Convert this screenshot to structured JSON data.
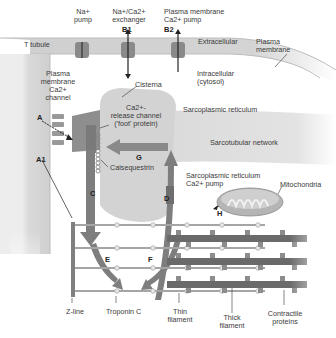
{
  "diagram": {
    "colors": {
      "membrane": "#c9c9c9",
      "ttubule": "#d6d6d6",
      "sr": "#cfcfcf",
      "arrow": "#7a7a7a",
      "thick_filament": "#666666",
      "thin_filament": "#a7a7a7"
    },
    "top_labels": {
      "na_pump": "Na+\npump",
      "exchanger": "Na+/Ca2+\nexchanger",
      "exchanger_id": "B1",
      "pm_pump": "Plasma membrane\nCa2+ pump",
      "pm_pump_id": "B2"
    },
    "regions": {
      "t_tubule": "T tubule",
      "extracellular": "Extracellular",
      "plasma_membrane": "Plasma\nmembrane",
      "intracellular": "Intracellular\n(cytosol)",
      "sarcoplasmic_reticulum": "Sarcoplasmic reticulum",
      "sarcotubular_network": "Sarcotubular network",
      "cisterna": "Cisterna"
    },
    "structures": {
      "pm_ca_channel": "Plasma\nmembrane\nCa2+\nchannel",
      "release_channel": "Ca2+-\nrelease channel\n('foot' protein)",
      "calsequestrin": "Calsequestrin",
      "sr_pump": "Sarcoplasmic reticulum\nCa2+ pump",
      "mitochondria": "Mitochondria"
    },
    "pathway_labels": [
      "A",
      "A1",
      "C",
      "D",
      "E",
      "F",
      "G",
      "H"
    ],
    "bottom_labels": {
      "z_line": "Z-line",
      "troponin_c": "Troponin C",
      "thin_filament": "Thin\nfilament",
      "thick_filament": "Thick\nfilament",
      "contractile_proteins": "Contractile\nproteins"
    }
  }
}
